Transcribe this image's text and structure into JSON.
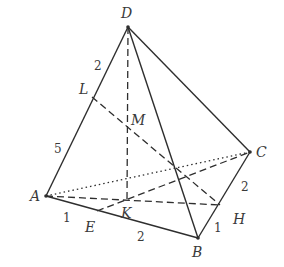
{
  "figure": {
    "type": "tetrahedron",
    "points": {
      "D": {
        "label": "D",
        "x": 128,
        "y": 27,
        "lx": 121,
        "ly": 18
      },
      "A": {
        "label": "A",
        "x": 46,
        "y": 196,
        "lx": 30,
        "ly": 201
      },
      "B": {
        "label": "B",
        "x": 198,
        "y": 238,
        "lx": 192,
        "ly": 257
      },
      "C": {
        "label": "C",
        "x": 250,
        "y": 152,
        "lx": 256,
        "ly": 157
      },
      "L": {
        "label": "L",
        "x": 92,
        "y": 97,
        "lx": 79,
        "ly": 94
      },
      "M": {
        "label": "M",
        "x": 127,
        "y": 124,
        "lx": 131,
        "ly": 125
      },
      "K": {
        "label": "K",
        "x": 127,
        "y": 201,
        "lx": 121,
        "ly": 218
      },
      "E": {
        "label": "E",
        "x": 97,
        "y": 211,
        "lx": 85,
        "ly": 232
      },
      "H": {
        "label": "H",
        "x": 220,
        "y": 205,
        "lx": 233,
        "ly": 224
      }
    },
    "segment_labels": [
      {
        "id": "DL",
        "text": "2",
        "x": 94,
        "y": 70
      },
      {
        "id": "LA",
        "text": "5",
        "x": 54,
        "y": 153
      },
      {
        "id": "AE",
        "text": "1",
        "x": 63,
        "y": 222
      },
      {
        "id": "EB",
        "text": "2",
        "x": 137,
        "y": 241
      },
      {
        "id": "CH",
        "text": "2",
        "x": 241,
        "y": 191
      },
      {
        "id": "HB",
        "text": "1",
        "x": 214,
        "y": 232
      }
    ],
    "edges": {
      "solid": [
        [
          "D",
          "A"
        ],
        [
          "D",
          "B"
        ],
        [
          "D",
          "C"
        ],
        [
          "A",
          "B"
        ],
        [
          "B",
          "C"
        ]
      ],
      "dotted": [
        [
          "A",
          "C"
        ]
      ],
      "dashed": [
        [
          "D",
          "K"
        ],
        [
          "L",
          "H"
        ],
        [
          "A",
          "H"
        ],
        [
          "E",
          "C"
        ]
      ]
    }
  }
}
